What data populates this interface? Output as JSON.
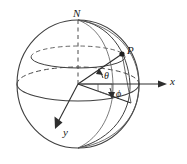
{
  "figure": {
    "colors": {
      "stroke": "#3a3a3a",
      "stroke_light": "#6e6e6e",
      "background": "#ffffff",
      "text": "#1a1a1a"
    },
    "labels": {
      "north_pole": "N",
      "point": "P",
      "x_axis": "x",
      "y_axis": "y",
      "polar_angle": "θ",
      "azimuth_angle": "ϕ"
    },
    "geometry": {
      "center_x": 78,
      "center_y": 84,
      "radius_x": 61,
      "radius_y": 64,
      "north_pole_x": 78,
      "north_pole_y": 20,
      "south_pole_x": 78,
      "south_pole_y": 148,
      "point_p_x": 122,
      "point_p_y": 54,
      "x_axis_tip_x": 166,
      "x_axis_tip_y": 84,
      "y_axis_tip_x": 56,
      "y_axis_tip_y": 124,
      "equator_ry": 17,
      "upper_latitude_y": 57,
      "upper_latitude_ry": 11
    }
  }
}
